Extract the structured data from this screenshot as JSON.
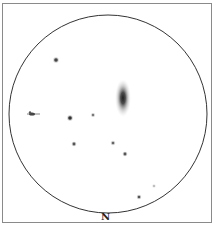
{
  "sketch": {
    "orientation_label": "N",
    "field_circle": {
      "cx": 108,
      "cy": 114,
      "r": 99,
      "stroke": "#333333"
    },
    "galaxy": {
      "cx": 123,
      "cy": 98,
      "rx": 8,
      "ry": 19,
      "core_color": "#222222"
    },
    "stars": [
      {
        "x": 56,
        "y": 60,
        "r": 1.8,
        "color": "#444444"
      },
      {
        "x": 70,
        "y": 118,
        "r": 1.8,
        "color": "#333333"
      },
      {
        "x": 93,
        "y": 115,
        "r": 1.2,
        "color": "#777777"
      },
      {
        "x": 74,
        "y": 144,
        "r": 1.4,
        "color": "#555555"
      },
      {
        "x": 113,
        "y": 143,
        "r": 1.3,
        "color": "#666666"
      },
      {
        "x": 125,
        "y": 154,
        "r": 1.4,
        "color": "#555555"
      },
      {
        "x": 154,
        "y": 186,
        "r": 0.9,
        "color": "#aaaaaa"
      },
      {
        "x": 139,
        "y": 197,
        "r": 1.3,
        "color": "#555555"
      }
    ],
    "double_star": {
      "x": 33,
      "y": 114
    }
  }
}
